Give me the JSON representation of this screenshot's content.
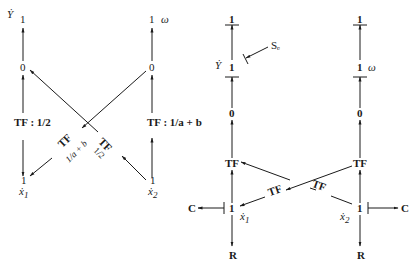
{
  "left_graph": {
    "col1": {
      "top_var": "Ẏ",
      "top_junction": "1",
      "mid_junction": "0",
      "tf_label": "TF : 1/2",
      "bottom_junction": "1",
      "bottom_var": "ẋ",
      "bottom_sub": "1"
    },
    "col2": {
      "top_junction": "1",
      "top_var": "ω",
      "mid_junction": "0",
      "tf_label": "TF : 1/a + b",
      "bottom_junction": "1",
      "bottom_var": "ẋ",
      "bottom_sub": "2"
    },
    "cross_tf_left": {
      "name": "TF",
      "ratio": "1/a + b"
    },
    "cross_tf_right": {
      "name": "TF",
      "ratio": "1/2"
    }
  },
  "right_graph": {
    "col1": {
      "top_junction": "1",
      "var": "Ẏ",
      "junction2": "1",
      "source": "Sₑ",
      "junction3": "0",
      "tf": "TF",
      "junction4": "1",
      "var4": "ẋ",
      "var4_sub": "1",
      "c_element": "C",
      "r_element": "R"
    },
    "col2": {
      "top_junction": "1",
      "junction2": "1",
      "var": "ω",
      "junction3": "0",
      "tf": "TF",
      "junction4": "1",
      "var4": "ẋ",
      "var4_sub": "2",
      "c_element": "C",
      "r_element": "R"
    },
    "cross_tf_a": "TF",
    "cross_tf_b": "TF"
  }
}
